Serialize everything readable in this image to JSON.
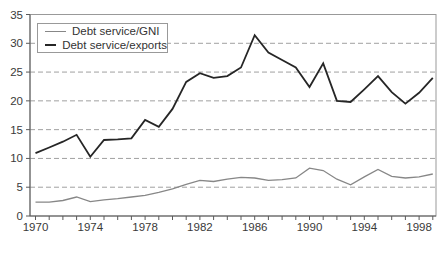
{
  "chart_data": {
    "type": "line",
    "title": "",
    "xlabel": "",
    "ylabel": "",
    "x": [
      1970,
      1971,
      1972,
      1973,
      1974,
      1975,
      1976,
      1977,
      1978,
      1979,
      1980,
      1981,
      1982,
      1983,
      1984,
      1985,
      1986,
      1987,
      1988,
      1989,
      1990,
      1991,
      1992,
      1993,
      1994,
      1995,
      1996,
      1997,
      1998,
      1999
    ],
    "series": [
      {
        "name": "Debt service/GNI",
        "color": "#878787",
        "stroke_width": 1.3,
        "values": [
          2.4,
          2.4,
          2.7,
          3.3,
          2.5,
          2.8,
          3.0,
          3.3,
          3.6,
          4.1,
          4.7,
          5.5,
          6.2,
          6.0,
          6.4,
          6.7,
          6.6,
          6.2,
          6.3,
          6.6,
          8.3,
          7.9,
          6.4,
          5.4,
          6.8,
          8.1,
          6.9,
          6.6,
          6.8,
          7.3
        ]
      },
      {
        "name": "Debt service/exports",
        "color": "#262626",
        "stroke_width": 1.8,
        "values": [
          10.9,
          11.9,
          12.9,
          14.1,
          10.3,
          13.2,
          13.3,
          13.5,
          16.7,
          15.5,
          18.6,
          23.3,
          24.8,
          24.0,
          24.3,
          25.8,
          31.4,
          28.4,
          27.1,
          25.8,
          22.4,
          26.5,
          20.0,
          19.8,
          22.0,
          24.3,
          21.5,
          19.5,
          21.4,
          24.0
        ]
      }
    ],
    "ylim": [
      0,
      35
    ],
    "yticks": [
      0,
      5,
      10,
      15,
      20,
      25,
      30,
      35
    ],
    "xtick_labels": [
      1970,
      1974,
      1978,
      1982,
      1986,
      1990,
      1994,
      1998
    ],
    "grid": "horizontal-dashed",
    "legend_position": "top-left",
    "colors": {
      "grid": "#a0a0a0",
      "frame": "#999999",
      "axis": "#5a5a5a",
      "tick_label": "#3a3a3a",
      "background": "#ffffff"
    }
  }
}
